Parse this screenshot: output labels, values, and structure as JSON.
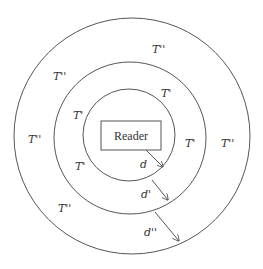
{
  "diagram": {
    "reader_label": "Reader",
    "zones": {
      "inner": "T'",
      "middle": "T''",
      "outer": "T''"
    },
    "labels": {
      "inner_ring": [
        "T'",
        "T'"
      ],
      "middle_ring": [
        "T'",
        "T'",
        "T'"
      ],
      "outer_ring": [
        "T''",
        "T''",
        "T''",
        "T''",
        "T''"
      ]
    },
    "distances": {
      "d1": "d",
      "d2": "d'",
      "d3": "d''"
    },
    "label_items": [
      {
        "id": "t-top-right-inner",
        "text": "T'"
      },
      {
        "id": "t-left-upper-mid",
        "text": "T'"
      },
      {
        "id": "t-right-mid",
        "text": "T'"
      },
      {
        "id": "t-left-lower-mid",
        "text": "T'"
      },
      {
        "id": "t-top-outer",
        "text": "T''"
      },
      {
        "id": "t-left-upper-outer",
        "text": "T''"
      },
      {
        "id": "t-left-outer",
        "text": "T''"
      },
      {
        "id": "t-right-outer",
        "text": "T''"
      },
      {
        "id": "t-left-lower-outer",
        "text": "T''"
      }
    ]
  }
}
